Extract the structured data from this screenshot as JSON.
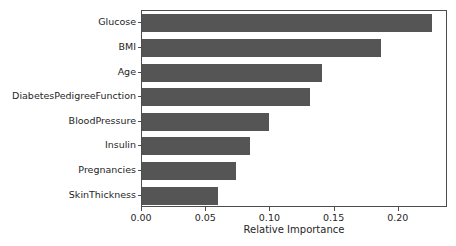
{
  "chart_data": {
    "type": "bar",
    "orientation": "horizontal",
    "title": "",
    "xlabel": "Relative Importance",
    "ylabel": "",
    "categories": [
      "Glucose",
      "BMI",
      "Age",
      "DiabetesPedigreeFunction",
      "BloodPressure",
      "Insulin",
      "Pregnancies",
      "SkinThickness"
    ],
    "values": [
      0.226,
      0.186,
      0.14,
      0.131,
      0.099,
      0.084,
      0.073,
      0.059
    ],
    "xlim": [
      0.0,
      0.2383
    ],
    "xticks": [
      0.0,
      0.05,
      0.1,
      0.15,
      0.2
    ],
    "xtick_labels": [
      "0.00",
      "0.05",
      "0.10",
      "0.15",
      "0.20"
    ],
    "grid": false,
    "legend": null,
    "bar_color": "#555555",
    "axes_color": "#4d4d4d",
    "background_color": "#ffffff"
  }
}
